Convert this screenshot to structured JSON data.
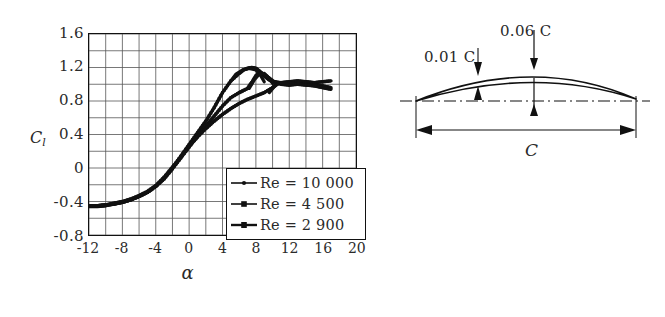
{
  "chart_data": {
    "type": "line",
    "title": "",
    "xlabel": "α",
    "ylabel": "C_l",
    "xlim": [
      -12,
      20
    ],
    "ylim": [
      -0.8,
      1.6
    ],
    "xticks": [
      -12,
      -8,
      -4,
      0,
      4,
      8,
      12,
      16,
      20
    ],
    "yticks": [
      1.6,
      1.2,
      0.8,
      0.4,
      0,
      -0.4,
      -0.8
    ],
    "xtick_labels": [
      "-12",
      "-8",
      "-4",
      "0",
      "4",
      "8",
      "12",
      "16",
      "20"
    ],
    "ytick_labels": [
      "1.6",
      "1.2",
      "0.8",
      "0.4",
      "0",
      "-0.4",
      "-0.8"
    ],
    "minor_grid_x_step": 2,
    "minor_grid_y_step": 0.2,
    "grid": true,
    "legend_position": "lower right",
    "series": [
      {
        "name": "Re = 10 000",
        "x": [
          -12,
          -11,
          -10,
          -9,
          -8,
          -7,
          -6,
          -5,
          -4,
          -3,
          -2,
          -1,
          0,
          1,
          2,
          3,
          4,
          5,
          6,
          6.5,
          7,
          7.5,
          8,
          8.5,
          9,
          9.5,
          10,
          11,
          12,
          13,
          14,
          15,
          16,
          17
        ],
        "y": [
          -0.45,
          -0.45,
          -0.44,
          -0.43,
          -0.41,
          -0.38,
          -0.34,
          -0.29,
          -0.22,
          -0.12,
          0.0,
          0.14,
          0.28,
          0.42,
          0.56,
          0.72,
          0.9,
          1.04,
          1.13,
          1.17,
          1.19,
          1.2,
          1.19,
          1.15,
          1.1,
          1.06,
          1.03,
          1.02,
          1.03,
          1.04,
          1.03,
          1.02,
          1.03,
          1.04
        ]
      },
      {
        "name": "Re = 4 500",
        "x": [
          -12,
          -11,
          -10,
          -9,
          -8,
          -7,
          -6,
          -5,
          -4,
          -3,
          -2,
          -1,
          0,
          1,
          2,
          3,
          4,
          5,
          6,
          7,
          7.5,
          8,
          8.5,
          9,
          9.5,
          10,
          11,
          12,
          13,
          14,
          15,
          16,
          17
        ],
        "y": [
          -0.46,
          -0.46,
          -0.45,
          -0.43,
          -0.41,
          -0.38,
          -0.34,
          -0.29,
          -0.22,
          -0.13,
          -0.01,
          0.12,
          0.25,
          0.38,
          0.5,
          0.62,
          0.74,
          0.84,
          0.9,
          0.95,
          1.02,
          1.1,
          1.14,
          1.12,
          1.08,
          1.04,
          1.0,
          0.99,
          1.0,
          1.0,
          0.99,
          0.98,
          0.96
        ]
      },
      {
        "name": "Re = 2 900",
        "x": [
          -12,
          -11,
          -10,
          -9,
          -8,
          -7,
          -6,
          -5,
          -4,
          -3,
          -2,
          -1,
          0,
          1,
          2,
          3,
          4,
          5,
          6,
          7,
          8,
          9,
          10,
          10.5,
          11,
          12,
          13,
          14,
          15,
          16,
          17
        ],
        "y": [
          -0.45,
          -0.45,
          -0.44,
          -0.42,
          -0.4,
          -0.37,
          -0.33,
          -0.28,
          -0.21,
          -0.11,
          0.01,
          0.13,
          0.26,
          0.37,
          0.47,
          0.56,
          0.64,
          0.71,
          0.77,
          0.82,
          0.86,
          0.9,
          0.96,
          1.0,
          1.02,
          1.02,
          1.0,
          0.99,
          0.98,
          0.96,
          0.94
        ]
      }
    ],
    "legend": [
      "Re = 10 000",
      "Re = 4 500",
      "Re = 2 900"
    ]
  },
  "chart": {
    "y_axis_label_main": "C",
    "y_axis_label_sub": "l",
    "x_axis_label": "α",
    "ytick_labels": [
      "1.6",
      "1.2",
      "0.8",
      "0.4",
      "0",
      "-0.4",
      "-0.8"
    ],
    "xtick_labels": [
      "-12",
      "-8",
      "-4",
      "0",
      "4",
      "8",
      "12",
      "16",
      "20"
    ]
  },
  "legend": {
    "items": [
      {
        "symbol": "re-10000-marker",
        "prefix": "Re",
        "equals": "=",
        "value": "10 000",
        "full": "Re = 10 000"
      },
      {
        "symbol": "re-4500-marker",
        "prefix": "Re",
        "equals": "=",
        "value": "4 500",
        "full": "Re = 4 500"
      },
      {
        "symbol": "re-2900-marker",
        "prefix": "Re",
        "equals": "=",
        "value": "2 900",
        "full": "Re = 2 900"
      }
    ]
  },
  "airfoil": {
    "camber_label": "0.06 C",
    "thickness_label": "0.01 C",
    "chord_label": "C",
    "description": "thin cambered plate airfoil cross-section with chord and camber dimensions"
  },
  "colors": {
    "ink": "#111111",
    "text": "#2a2a2a",
    "grid": "#555555",
    "background": "#ffffff"
  }
}
